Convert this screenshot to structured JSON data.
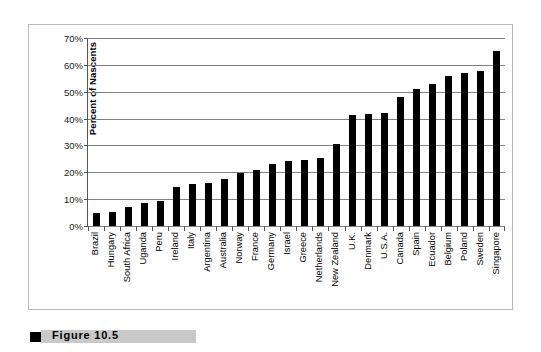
{
  "figure": {
    "caption_label": "Figure",
    "caption_number": "10.5",
    "caption_full": "Figure   10.5"
  },
  "chart_data": {
    "type": "bar",
    "title": "",
    "subtitle": "",
    "xlabel": "",
    "ylabel": "Percent of Nascents",
    "ylim": [
      0,
      70
    ],
    "ytick_labels": [
      "70%",
      "60%",
      "50%",
      "40%",
      "30%",
      "20%",
      "10%",
      "0%"
    ],
    "ytick_values": [
      70,
      60,
      50,
      40,
      30,
      20,
      10,
      0
    ],
    "grid": true,
    "legend": "none",
    "bar_color": "#000000",
    "categories": [
      "Brazil",
      "Hungary",
      "South Africa",
      "Uganda",
      "Peru",
      "Ireland",
      "Italy",
      "Argentina",
      "Australia",
      "Norway",
      "France",
      "Germany",
      "Israel",
      "Greece",
      "Netherlands",
      "New Zealand",
      "U.K.",
      "Denmark",
      "U.S.A.",
      "Canada",
      "Spain",
      "Ecuador",
      "Belgium",
      "Poland",
      "Sweden",
      "Singapore"
    ],
    "values": [
      5.0,
      5.3,
      7.0,
      8.4,
      9.3,
      14.7,
      15.8,
      16.1,
      17.5,
      19.7,
      21.0,
      23.1,
      24.1,
      24.7,
      25.3,
      30.4,
      41.3,
      41.6,
      42.2,
      48.0,
      51.2,
      53.0,
      55.7,
      56.8,
      57.8,
      65.0
    ]
  },
  "colors": {
    "bar": "#000000",
    "gridline": "#808080",
    "axis": "#555555",
    "frame": "#b9b9b9",
    "caption_band": "#c9c9c9"
  }
}
